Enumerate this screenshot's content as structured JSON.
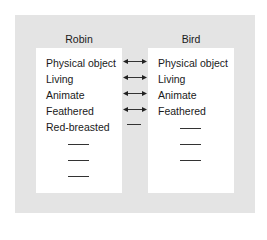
{
  "diagram": {
    "left_column": {
      "title": "Robin",
      "features": [
        "Physical object",
        "Living",
        "Animate",
        "Feathered",
        "Red-breasted"
      ],
      "blank_lines": 3
    },
    "right_column": {
      "title": "Bird",
      "features": [
        "Physical object",
        "Living",
        "Animate",
        "Feathered"
      ],
      "blank_lines": 3
    },
    "connectors": [
      {
        "row": 0,
        "type": "double-arrow"
      },
      {
        "row": 1,
        "type": "double-arrow"
      },
      {
        "row": 2,
        "type": "double-arrow"
      },
      {
        "row": 3,
        "type": "double-arrow"
      },
      {
        "row": 4,
        "type": "dash"
      }
    ],
    "colors": {
      "panel": "#e4e4e4",
      "box": "#ffffff",
      "text": "#1a1a1a"
    }
  }
}
